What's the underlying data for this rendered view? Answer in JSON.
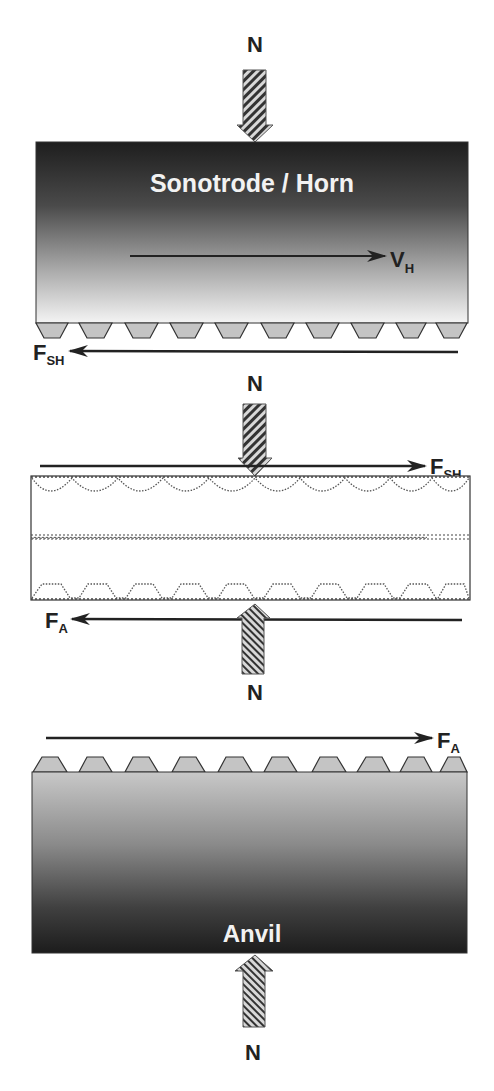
{
  "diagram": {
    "type": "ultrasonic welding force diagram",
    "labels": {
      "normal_force": "N",
      "horn": "Sonotrode / Horn",
      "anvil": "Anvil",
      "horn_velocity_main": "V",
      "horn_velocity_sub": "H",
      "shear_force_main": "F",
      "shear_force_sub": "SH",
      "anvil_force_main": "F",
      "anvil_force_sub": "A"
    },
    "colors": {
      "horn_top": "#1e1e1e",
      "horn_bottom": "#f4f4f4",
      "anvil_top": "#c8c8c8",
      "anvil_bottom": "#1c1c1c",
      "teeth": "#c4c4c4",
      "arrow": "#222222",
      "outline": "#333333"
    },
    "sections": [
      {
        "name": "horn",
        "teeth_count": 10
      },
      {
        "name": "workpieces",
        "layers": 2
      },
      {
        "name": "anvil",
        "teeth_count": 10
      }
    ]
  }
}
